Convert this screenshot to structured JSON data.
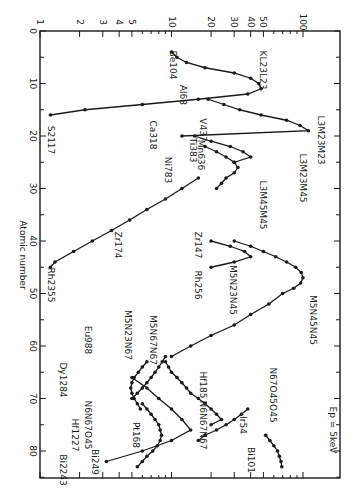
{
  "chart_data": {
    "type": "line",
    "title": "",
    "annotation": "Ep = 5keV",
    "orientation": "rotated 90deg (atomic number runs downward, yield on log scale runs rightward)",
    "xlabel": "Atomic number",
    "ylabel": "",
    "xlim": [
      0,
      85
    ],
    "ylim": [
      1,
      150
    ],
    "yscale": "log",
    "x_ticks": [
      0,
      10,
      20,
      30,
      40,
      50,
      60,
      70,
      80
    ],
    "y_ticks": [
      1,
      2,
      3,
      4,
      5,
      10,
      20,
      30,
      40,
      50,
      100
    ],
    "grid": false,
    "legend": "none (curves labeled directly)",
    "series": [
      {
        "name": "KL23L23",
        "x": [
          4,
          5,
          6,
          7,
          8,
          9,
          10,
          11,
          12,
          13,
          14,
          15,
          16
        ],
        "y": [
          10,
          11,
          13,
          18,
          30,
          40,
          46,
          48,
          38,
          16,
          6,
          2.2,
          1.2
        ],
        "start_label": "Be104",
        "end_label": "S2117"
      },
      {
        "name": "L3M23M23",
        "x": [
          13,
          14,
          15,
          16,
          17,
          18,
          19,
          20
        ],
        "y": [
          19,
          25,
          33,
          48,
          75,
          95,
          110,
          12
        ],
        "start_label": "Al68",
        "end_label": "Ca318"
      },
      {
        "name": "L3M23M45",
        "x": [
          20,
          21,
          22,
          23,
          24,
          25
        ],
        "y": [
          15,
          20,
          28,
          35,
          40,
          30
        ],
        "end_label": "V437"
      },
      {
        "name": "L3M45M45",
        "x": [
          22,
          23,
          24,
          25,
          26,
          27,
          28,
          29,
          30
        ],
        "y": [
          18,
          22,
          26,
          30,
          32,
          30,
          26,
          24,
          22
        ],
        "labels": [
          "Ti383",
          "Mn636",
          "Ni783"
        ]
      },
      {
        "name": "M5N23N45",
        "x": [
          40,
          41,
          42,
          43,
          44,
          45
        ],
        "y": [
          20,
          28,
          36,
          40,
          30,
          20
        ],
        "start_label": "Zr147",
        "end_label": "Rh256"
      },
      {
        "name": "M5N45N45",
        "x": [
          40,
          41,
          42,
          43,
          44,
          45,
          46,
          47,
          48,
          49,
          50,
          52,
          54,
          56,
          58,
          60,
          62
        ],
        "y": [
          30,
          40,
          50,
          62,
          75,
          88,
          97,
          100,
          96,
          85,
          70,
          55,
          40,
          30,
          20,
          14,
          10
        ],
        "start_label": "Zr174"
      },
      {
        "name": "M5N23N67",
        "x": [
          62,
          63,
          64,
          65,
          66,
          67,
          68,
          69,
          70
        ],
        "y": [
          9,
          8.5,
          8,
          7.5,
          7,
          6.5,
          6,
          5.5,
          5
        ]
      },
      {
        "name": "M5N67N67",
        "x": [
          63,
          64,
          65,
          66,
          67,
          68,
          69,
          70,
          71,
          72,
          73,
          74,
          75
        ],
        "y": [
          9,
          9.5,
          10,
          11,
          12,
          13,
          14,
          16,
          18,
          20,
          22,
          24,
          20
        ],
        "start_label": "Eu988"
      },
      {
        "name": "N6N67O45",
        "x": [
          71,
          72,
          73,
          74,
          75,
          76,
          77,
          78,
          79,
          80,
          81,
          82,
          83
        ],
        "y": [
          6,
          6.5,
          7,
          7.5,
          8,
          8.2,
          8.4,
          8.2,
          7.8,
          7.2,
          6.5,
          6,
          5.5
        ],
        "end_label": "Bi249"
      },
      {
        "name": "N67N67 (Dy-Bi)",
        "x": [
          66,
          68,
          70,
          72,
          74,
          76,
          78,
          80,
          82
        ],
        "y": [
          5,
          6.5,
          8,
          10,
          12,
          14,
          10,
          6,
          3.2
        ],
        "start_label": "Dy1284",
        "end_label": "Bi2243"
      },
      {
        "name": "Hf1227 branch",
        "x": [
          63,
          64,
          65,
          66,
          67,
          68,
          69,
          70,
          71,
          72
        ],
        "y": [
          6.5,
          6,
          5.6,
          5.2,
          5,
          4.9,
          5,
          5.2,
          5.5,
          5.8
        ],
        "end_label": "Hf1227"
      },
      {
        "name": "N6N67N67",
        "x": [
          72,
          73,
          74,
          75,
          76,
          77,
          78
        ],
        "y": [
          38,
          34,
          30,
          26,
          22,
          18,
          16
        ],
        "start_label": "Hf185",
        "end_label": "Pt168"
      },
      {
        "name": "N67O45O45",
        "x": [
          77,
          78,
          79,
          80,
          81,
          82,
          83
        ],
        "y": [
          52,
          56,
          60,
          64,
          66,
          68,
          69
        ],
        "start_label": "Ir54",
        "end_label": "Bi101"
      },
      {
        "name": "diagonal (Ni-Rh)",
        "x": [
          28,
          30,
          32,
          34,
          36,
          38,
          40,
          42,
          44,
          45
        ],
        "y": [
          16,
          12,
          9,
          6.5,
          4.8,
          3.5,
          2.5,
          1.8,
          1.3,
          1.2
        ],
        "start_label": "Ni783",
        "end_label": "Rh2355"
      }
    ],
    "curve_labels": [
      "KL23L23",
      "L3M23M23",
      "L3M23M45",
      "L3M45M45",
      "M5N23N45",
      "M5N45N45",
      "M5N23N67",
      "M5N67N67",
      "N6N67O45",
      "N6N67N67",
      "N67O45O45"
    ],
    "point_labels": [
      "Be104",
      "S2117",
      "Al68",
      "Ca318",
      "Ti383",
      "V437",
      "Mn636",
      "Ni783",
      "Zr147",
      "Zr174",
      "Rh256",
      "Rh2355",
      "Eu988",
      "Dy1284",
      "Hf1227",
      "Hf185",
      "Pt168",
      "Bi249",
      "Bi2243",
      "Ir54",
      "Bi101"
    ]
  },
  "axis": {
    "xlabel": "Atomic number",
    "x_tick_labels": [
      "0",
      "10",
      "20",
      "30",
      "40",
      "50",
      "60",
      "70",
      "80"
    ],
    "y_tick_labels": [
      "1",
      "2",
      "3",
      "4",
      "5",
      "10",
      "20",
      "30",
      "40",
      "50",
      "100"
    ],
    "annotation": "Ep = 5keV"
  }
}
